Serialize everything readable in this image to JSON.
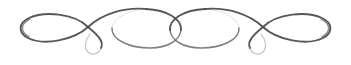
{
  "canvas": {
    "width": 351,
    "height": 65,
    "background_color": "#ffffff"
  },
  "ornament": {
    "name": "calligraphic-flourish-divider",
    "description": "Symmetric scanned ink flourish divider",
    "ink_color": "#4a4a4a",
    "ink_color_light": "#6e6e6e",
    "ink_color_faint": "#9a9a9a",
    "orientation": "horizontal",
    "symmetry": "bilateral",
    "parts": [
      {
        "label": "left-outer-loop"
      },
      {
        "label": "left-descending-curl"
      },
      {
        "label": "left-center-oval"
      },
      {
        "label": "right-center-oval"
      },
      {
        "label": "right-descending-curl"
      },
      {
        "label": "right-outer-loop"
      }
    ]
  },
  "geometry": {
    "left_loop": {
      "upper": "M 88 27 C 74 13, 44 11, 29 18 C 18 23, 18 33, 28 38 C 44 46, 74 40, 88 27",
      "tail": "M 88 27 C 99 36, 104 42, 101 48"
    },
    "left_curl": {
      "hook": "M 101 48 C 99 54, 92 56, 88 52 C 84 48, 85 40, 90 34"
    },
    "left_sweep": {
      "arc": "M 88 27 C 102 14, 124 7, 146 9"
    },
    "center_left_oval": {
      "ring": "M 146 9 C 128 10, 113 18, 112 28 C 111 40, 130 48, 150 48 C 168 48, 180 40, 181 30 C 182 19, 167 10, 146 9"
    },
    "center_right_oval": {
      "ring": "M 205 9 C 223 10, 238 18, 239 28 C 240 40, 221 48, 201 48 C 183 48, 171 40, 170 30 C 169 19, 184 10, 205 9"
    },
    "right_sweep": {
      "arc": "M 263 27 C 249 14, 227 7, 205 9"
    },
    "right_loop": {
      "upper": "M 263 27 C 277 13, 307 11, 322 18 C 333 23, 333 33, 323 38 C 307 46, 277 40, 263 27",
      "tail": "M 263 27 C 252 36, 247 42, 250 48"
    },
    "right_curl": {
      "hook": "M 250 48 C 252 54, 259 56, 263 52 C 267 48, 266 40, 261 34"
    }
  }
}
